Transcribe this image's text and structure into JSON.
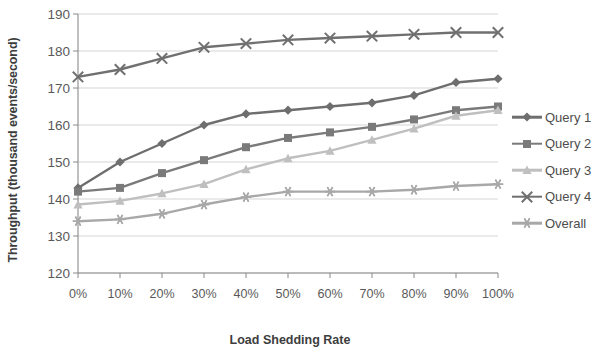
{
  "chart_data": {
    "type": "line",
    "title": "",
    "xlabel": "Load Shedding Rate",
    "ylabel": "Throughput (thousand events/second)",
    "categories": [
      "0%",
      "10%",
      "20%",
      "30%",
      "40%",
      "50%",
      "60%",
      "70%",
      "80%",
      "90%",
      "100%"
    ],
    "ylim": [
      120,
      190
    ],
    "yticks": [
      120,
      130,
      140,
      150,
      160,
      170,
      180,
      190
    ],
    "grid": true,
    "legend_position": "right",
    "series": [
      {
        "name": "Query 1",
        "marker": "diamond",
        "color": "#6e6e6e",
        "values": [
          143,
          150,
          155,
          160,
          163,
          164,
          165,
          166,
          168,
          171.5,
          172.5
        ]
      },
      {
        "name": "Query 2",
        "marker": "square",
        "color": "#7a7a7a",
        "values": [
          142,
          143,
          147,
          150.5,
          154,
          156.5,
          158,
          159.5,
          161.5,
          164,
          165
        ]
      },
      {
        "name": "Query 3",
        "marker": "triangle",
        "color": "#bfbfbf",
        "values": [
          138.5,
          139.5,
          141.5,
          144,
          148,
          151,
          153,
          156,
          159,
          162.5,
          164
        ]
      },
      {
        "name": "Query 4",
        "marker": "cross",
        "color": "#707070",
        "values": [
          173,
          175,
          178,
          181,
          182,
          183,
          183.5,
          184,
          184.5,
          185,
          185
        ]
      },
      {
        "name": "Overall",
        "marker": "asterisk",
        "color": "#a8a8a8",
        "values": [
          134,
          134.5,
          136,
          138.5,
          140.5,
          142,
          142,
          142,
          142.5,
          143.5,
          144
        ]
      }
    ]
  }
}
